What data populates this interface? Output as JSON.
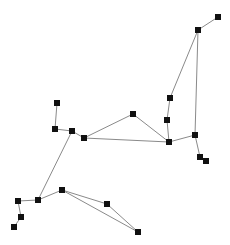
{
  "diagram": {
    "type": "graph",
    "width": 230,
    "height": 245,
    "colors": {
      "edge": "#8a8a8a",
      "node": "#111111",
      "background": "#ffffff"
    },
    "node_size": 6,
    "nodes": [
      {
        "id": "n1",
        "x": 218,
        "y": 17
      },
      {
        "id": "n2",
        "x": 198,
        "y": 30
      },
      {
        "id": "n3",
        "x": 170,
        "y": 98
      },
      {
        "id": "n4",
        "x": 167,
        "y": 120
      },
      {
        "id": "n5",
        "x": 169,
        "y": 142
      },
      {
        "id": "n6",
        "x": 195,
        "y": 135
      },
      {
        "id": "n7",
        "x": 200,
        "y": 157
      },
      {
        "id": "n8",
        "x": 206,
        "y": 161
      },
      {
        "id": "n9",
        "x": 133,
        "y": 114
      },
      {
        "id": "n10",
        "x": 84,
        "y": 138
      },
      {
        "id": "n11",
        "x": 72,
        "y": 131
      },
      {
        "id": "n12",
        "x": 55,
        "y": 129
      },
      {
        "id": "n13",
        "x": 57,
        "y": 103
      },
      {
        "id": "n14",
        "x": 38,
        "y": 200
      },
      {
        "id": "n15",
        "x": 18,
        "y": 201
      },
      {
        "id": "n16",
        "x": 21,
        "y": 217
      },
      {
        "id": "n17",
        "x": 14,
        "y": 227
      },
      {
        "id": "n18",
        "x": 62,
        "y": 190
      },
      {
        "id": "n19",
        "x": 107,
        "y": 204
      },
      {
        "id": "n20",
        "x": 138,
        "y": 232
      }
    ],
    "edges": [
      [
        "n1",
        "n2"
      ],
      [
        "n2",
        "n3"
      ],
      [
        "n2",
        "n6"
      ],
      [
        "n3",
        "n4"
      ],
      [
        "n4",
        "n5"
      ],
      [
        "n5",
        "n6"
      ],
      [
        "n6",
        "n7"
      ],
      [
        "n5",
        "n9"
      ],
      [
        "n5",
        "n10"
      ],
      [
        "n9",
        "n10"
      ],
      [
        "n10",
        "n11"
      ],
      [
        "n11",
        "n12"
      ],
      [
        "n12",
        "n13"
      ],
      [
        "n11",
        "n14"
      ],
      [
        "n14",
        "n15"
      ],
      [
        "n15",
        "n16"
      ],
      [
        "n16",
        "n17"
      ],
      [
        "n14",
        "n18"
      ],
      [
        "n18",
        "n19"
      ],
      [
        "n18",
        "n20"
      ],
      [
        "n19",
        "n20"
      ]
    ]
  }
}
